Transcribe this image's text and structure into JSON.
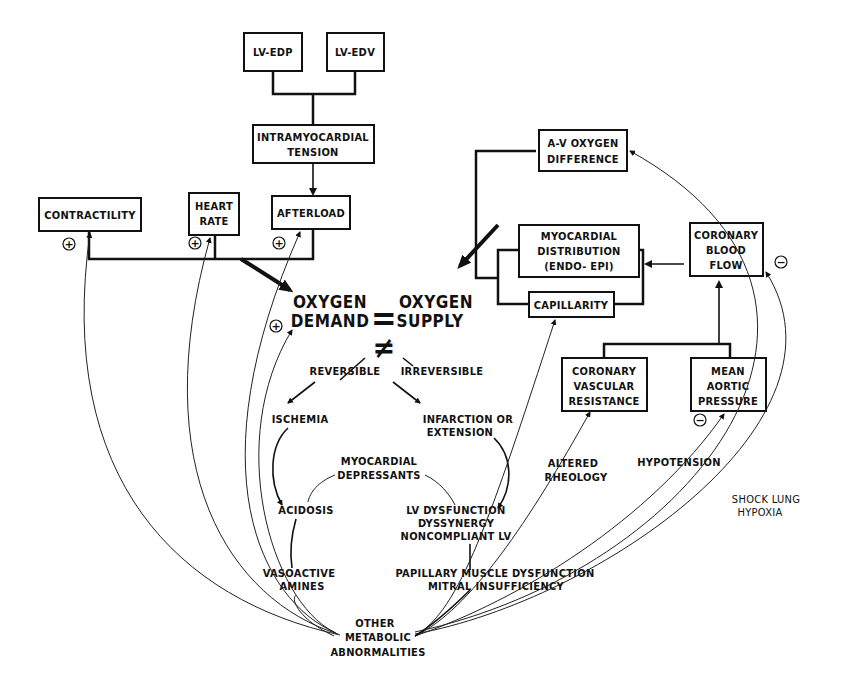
{
  "boxes": {
    "lv_edp": "LV-EDP",
    "lv_edv": "LV-EDV",
    "intramyocardial_tension": [
      "INTRAMYOCARDIAL",
      "TENSION"
    ],
    "contractility": "CONTRACTILITY",
    "heart_rate": [
      "HEART",
      "RATE"
    ],
    "afterload": "AFTERLOAD",
    "av_oxygen_difference": [
      "A-V OXYGEN",
      "DIFFERENCE"
    ],
    "myocardial_distribution": [
      "MYOCARDIAL",
      "DISTRIBUTION",
      "(ENDO- EPI)"
    ],
    "capillarity": "CAPILLARITY",
    "coronary_blood_flow": [
      "CORONARY",
      "BLOOD",
      "FLOW"
    ],
    "coronary_vascular_resistance": [
      "CORONARY",
      "VASCULAR",
      "RESISTANCE"
    ],
    "mean_aortic_pressure": [
      "MEAN",
      "AORTIC",
      "PRESSURE"
    ]
  },
  "center": {
    "demand": [
      "OXYGEN",
      "DEMAND"
    ],
    "equals": "=",
    "supply": [
      "OXYGEN",
      "SUPPLY"
    ],
    "not_equal": "≠",
    "reversible": "REVERSIBLE",
    "irreversible": "IRREVERSIBLE"
  },
  "consequences": {
    "ischemia": "ISCHEMIA",
    "infarction": [
      "INFARCTION OR",
      "EXTENSION"
    ],
    "myocardial_depressants": [
      "MYOCARDIAL",
      "DEPRESSANTS"
    ],
    "acidosis": "ACIDOSIS",
    "lv_dysfunction": [
      "LV DYSFUNCTION",
      "DYSSYNERGY",
      "NONCOMPLIANT LV"
    ],
    "vasoactive_amines": [
      "VASOACTIVE",
      "AMINES"
    ],
    "papillary_muscle": [
      "PAPILLARY MUSCLE DYSFUNCTION",
      "MITRAL INSUFFICIENCY"
    ],
    "other_metabolic": [
      "OTHER",
      "METABOLIC",
      "ABNORMALITIES"
    ],
    "altered_rheology": [
      "ALTERED",
      "RHEOLOGY"
    ],
    "hypotension": "HYPOTENSION",
    "shock_lung": [
      "SHOCK LUNG",
      "HYPOXIA"
    ]
  },
  "signs": {
    "plus": "+",
    "minus": "−"
  }
}
